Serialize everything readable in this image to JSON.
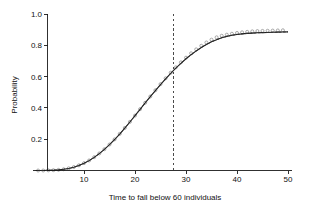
{
  "chart_data": {
    "type": "line",
    "title": "",
    "subtitle": "",
    "xlabel": "Time to fall below 60 individuals",
    "ylabel": "Probability",
    "xlim": [
      0,
      51
    ],
    "ylim": [
      0,
      1.0
    ],
    "grid": false,
    "legend": null,
    "xticks": [
      10,
      20,
      30,
      40,
      50
    ],
    "xtick_labels": [
      "10",
      "20",
      "30",
      "40",
      "50"
    ],
    "yticks": [
      0.2,
      0.4,
      0.6,
      0.8,
      1.0
    ],
    "ytick_labels": [
      "0.2",
      "0.4",
      "0.6",
      "0.8",
      "1.0"
    ],
    "annotations": [
      {
        "name": "median-time-vline",
        "type": "vline",
        "x": 27.5,
        "style": "dashed",
        "label": ""
      }
    ],
    "series": [
      {
        "name": "empirical-cdf-markers",
        "style": "open-circle-markers",
        "color": "#8d8d8d",
        "x": [
          1,
          2,
          3,
          4,
          5,
          6,
          7,
          8,
          9,
          10,
          11,
          12,
          13,
          14,
          15,
          16,
          17,
          18,
          19,
          20,
          21,
          22,
          23,
          24,
          25,
          26,
          27,
          28,
          29,
          30,
          31,
          32,
          33,
          34,
          35,
          36,
          37,
          38,
          39,
          40,
          41,
          42,
          43,
          44,
          45,
          46,
          47,
          48,
          49
        ],
        "y": [
          0.0,
          0.0,
          0.001,
          0.002,
          0.004,
          0.008,
          0.014,
          0.022,
          0.033,
          0.047,
          0.064,
          0.085,
          0.109,
          0.136,
          0.166,
          0.199,
          0.234,
          0.272,
          0.311,
          0.351,
          0.392,
          0.433,
          0.473,
          0.513,
          0.552,
          0.589,
          0.625,
          0.659,
          0.691,
          0.721,
          0.749,
          0.774,
          0.797,
          0.818,
          0.836,
          0.851,
          0.861,
          0.868,
          0.874,
          0.879,
          0.883,
          0.886,
          0.889,
          0.891,
          0.892,
          0.893,
          0.894,
          0.895,
          0.896
        ]
      },
      {
        "name": "fitted-model-line",
        "style": "solid",
        "color": "#1c1c1c",
        "x": [
          0,
          1,
          2,
          3,
          4,
          5,
          6,
          7,
          8,
          9,
          10,
          11,
          12,
          13,
          14,
          15,
          16,
          17,
          18,
          19,
          20,
          21,
          22,
          23,
          24,
          25,
          26,
          27,
          28,
          29,
          30,
          31,
          32,
          33,
          34,
          35,
          36,
          37,
          38,
          39,
          40,
          41,
          42,
          43,
          44,
          45,
          46,
          47,
          48,
          49,
          50
        ],
        "y": [
          0.0,
          0.0,
          0.0,
          0.001,
          0.002,
          0.004,
          0.008,
          0.013,
          0.021,
          0.032,
          0.046,
          0.063,
          0.084,
          0.108,
          0.135,
          0.165,
          0.198,
          0.233,
          0.271,
          0.31,
          0.35,
          0.391,
          0.432,
          0.472,
          0.511,
          0.549,
          0.586,
          0.621,
          0.654,
          0.685,
          0.714,
          0.74,
          0.764,
          0.786,
          0.805,
          0.822,
          0.836,
          0.848,
          0.857,
          0.864,
          0.869,
          0.873,
          0.876,
          0.878,
          0.88,
          0.881,
          0.882,
          0.883,
          0.884,
          0.885,
          0.886
        ]
      },
      {
        "name": "confidence-dashed-line",
        "style": "dashed",
        "color": "#303030",
        "x": [
          0,
          1,
          2,
          3,
          4,
          5,
          6,
          7,
          8,
          9,
          10,
          11,
          12,
          13,
          14,
          15,
          16,
          17,
          18,
          19,
          20,
          21,
          22,
          23,
          24,
          25,
          26,
          27,
          28,
          29,
          30,
          31,
          32,
          33,
          34,
          35,
          36,
          37,
          38,
          39,
          40,
          41,
          42,
          43,
          44,
          45,
          46,
          47,
          48,
          49,
          50
        ],
        "y": [
          0.0,
          0.0,
          0.0,
          0.001,
          0.002,
          0.004,
          0.008,
          0.013,
          0.021,
          0.032,
          0.046,
          0.063,
          0.084,
          0.108,
          0.135,
          0.165,
          0.198,
          0.233,
          0.271,
          0.31,
          0.35,
          0.391,
          0.432,
          0.472,
          0.511,
          0.549,
          0.586,
          0.621,
          0.654,
          0.685,
          0.714,
          0.74,
          0.764,
          0.786,
          0.805,
          0.822,
          0.836,
          0.848,
          0.857,
          0.864,
          0.869,
          0.873,
          0.876,
          0.878,
          0.88,
          0.881,
          0.882,
          0.883,
          0.884,
          0.885,
          0.886
        ]
      }
    ]
  },
  "colors": {
    "axis": "#1a1a1a",
    "line": "#1c1c1c",
    "marker": "#8d8d8d",
    "vline": "#2a2a2a",
    "background": "#ffffff"
  }
}
